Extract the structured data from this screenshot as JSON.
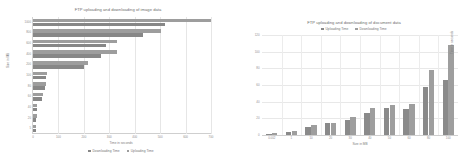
{
  "colors": {
    "background": "#ffffff",
    "uploading_bar": "#9d9d9d",
    "downloading_bar": "#878787",
    "gridline": "#e6e6e6",
    "axis": "#cfcfcf",
    "text": "#7d7d7d"
  },
  "left_chart": {
    "title": "FTP uploading and downloading of image data",
    "xlabel": "Time in seconds",
    "ylabel": "Size in MB",
    "legend": [
      {
        "label": "Downloading Time",
        "color": "#878787"
      },
      {
        "label": "Uploading Time",
        "color": "#9d9d9d"
      }
    ]
  },
  "right_chart": {
    "title": "FTP uploading and downloading of document data",
    "xlabel": "Size in MB",
    "ylabel": "Time in seconds",
    "legend": [
      {
        "label": "Uploading Time",
        "color": "#8a8a8a"
      },
      {
        "label": "Downloading Time",
        "color": "#9e9e9e"
      }
    ]
  },
  "chart_data": [
    {
      "type": "bar",
      "orientation": "horizontal",
      "title": "FTP uploading and downloading of image data",
      "xlabel": "Time in seconds",
      "ylabel": "Size in MB",
      "categories": [
        "1000",
        "800",
        "600",
        "400",
        "200",
        "100",
        "80",
        "60",
        "40",
        "20",
        "5"
      ],
      "xlim": [
        0,
        700
      ],
      "xticks": [
        0,
        100,
        200,
        300,
        400,
        500,
        600,
        700
      ],
      "xticklabels": [
        "0",
        "100",
        "200",
        "300",
        "400",
        "500",
        "600",
        "700"
      ],
      "grid": true,
      "legend_position": "bottom",
      "series": [
        {
          "name": "Downloading Time",
          "color": "#878787",
          "values": [
            520,
            432,
            288,
            268,
            200,
            50,
            46,
            34,
            14,
            13,
            11
          ]
        },
        {
          "name": "Uploading Time",
          "color": "#9d9d9d",
          "values": [
            700,
            505,
            330,
            330,
            215,
            57,
            50,
            38,
            16,
            14,
            12
          ]
        }
      ]
    },
    {
      "type": "bar",
      "orientation": "vertical",
      "title": "FTP uploading and downloading of document data",
      "xlabel": "Size in MB",
      "ylabel": "Time in seconds",
      "categories": [
        "0.002",
        "1",
        "10",
        "20",
        "30",
        "40",
        "50",
        "60",
        "80",
        "100"
      ],
      "ylim": [
        0,
        120
      ],
      "yticks": [
        0,
        20,
        40,
        60,
        80,
        100,
        120
      ],
      "yticklabels": [
        "0",
        "20",
        "40",
        "60",
        "80",
        "100",
        "120"
      ],
      "grid": true,
      "legend_position": "top",
      "series": [
        {
          "name": "Uploading Time",
          "color": "#8a8a8a",
          "values": [
            1,
            4,
            10,
            14,
            18,
            26,
            32,
            31,
            58,
            66
          ]
        },
        {
          "name": "Downloading Time",
          "color": "#9e9e9e",
          "values": [
            2,
            5,
            12,
            15,
            22,
            33,
            36,
            37,
            78,
            108
          ]
        }
      ]
    }
  ]
}
